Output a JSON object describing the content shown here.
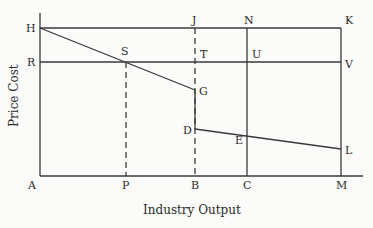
{
  "diagram": {
    "x_axis_title": "Industry Output",
    "y_axis_title": "Price Cost",
    "colors": {
      "line": "#3a3a3a",
      "background": "#fbfbf9"
    },
    "points": {
      "A": "A",
      "P": "P",
      "B": "B",
      "C": "C",
      "M": "M",
      "H": "H",
      "R": "R",
      "S": "S",
      "J": "J",
      "N": "N",
      "K": "K",
      "T": "T",
      "U": "U",
      "V": "V",
      "G": "G",
      "D": "D",
      "E": "E",
      "L": "L"
    },
    "lines": [
      {
        "from": "H",
        "to": "K",
        "style": "solid",
        "desc": "horizontal top line"
      },
      {
        "from": "R",
        "to": "V",
        "style": "solid",
        "desc": "horizontal line at R"
      },
      {
        "from": "H",
        "to": "G",
        "style": "solid",
        "desc": "downward sloping segment through S"
      },
      {
        "from": "G",
        "to": "D",
        "style": "solid",
        "desc": "vertical drop at B"
      },
      {
        "from": "D",
        "to": "L",
        "style": "solid",
        "desc": "downward sloping segment through E"
      },
      {
        "from": "S",
        "to": "P",
        "style": "dashed"
      },
      {
        "from": "J",
        "to": "B",
        "style": "dashed"
      },
      {
        "from": "N",
        "to": "C",
        "style": "solid"
      },
      {
        "from": "K",
        "to": "M",
        "style": "solid"
      }
    ]
  }
}
